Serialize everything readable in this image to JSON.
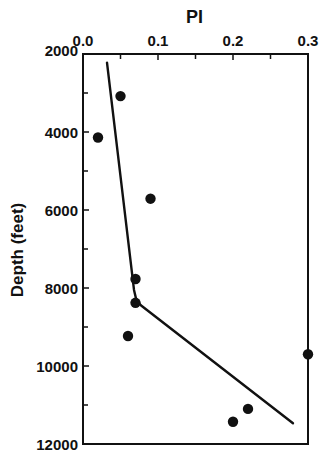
{
  "chart_data": {
    "type": "scatter",
    "title": "PI",
    "xlabel": "PI",
    "ylabel": "Depth (feet)",
    "x_axis_position": "top",
    "y_axis_inverted": true,
    "xlim": [
      0.0,
      0.3
    ],
    "ylim": [
      2000,
      12000
    ],
    "x_ticks": [
      "0.0",
      "0.1",
      "0.2",
      "0.3"
    ],
    "x_tick_values": [
      0.0,
      0.1,
      0.2,
      0.3
    ],
    "x_minor_ticks": [
      0.05,
      0.15,
      0.25
    ],
    "y_ticks": [
      "2000",
      "4000",
      "6000",
      "8000",
      "10000",
      "12000"
    ],
    "y_tick_values": [
      2000,
      4000,
      6000,
      8000,
      10000,
      12000
    ],
    "y_minor_ticks": [
      3000,
      5000,
      7000,
      9000,
      11000
    ],
    "grid": false,
    "legend": null,
    "series": [
      {
        "name": "Measured PI",
        "type": "scatter",
        "marker": "filled-circle",
        "points": [
          {
            "x": 0.05,
            "y": 3080
          },
          {
            "x": 0.02,
            "y": 4140
          },
          {
            "x": 0.09,
            "y": 5710
          },
          {
            "x": 0.07,
            "y": 7770
          },
          {
            "x": 0.07,
            "y": 8380
          },
          {
            "x": 0.06,
            "y": 9230
          },
          {
            "x": 0.3,
            "y": 9700
          },
          {
            "x": 0.22,
            "y": 11100
          },
          {
            "x": 0.2,
            "y": 11430
          }
        ]
      },
      {
        "name": "Trend",
        "type": "line",
        "points": [
          {
            "x": 0.032,
            "y": 2220
          },
          {
            "x": 0.068,
            "y": 8050
          },
          {
            "x": 0.071,
            "y": 8300
          },
          {
            "x": 0.077,
            "y": 8440
          },
          {
            "x": 0.28,
            "y": 11470
          }
        ]
      }
    ]
  },
  "colors": {
    "ink": "#111111",
    "background": "#ffffff"
  }
}
